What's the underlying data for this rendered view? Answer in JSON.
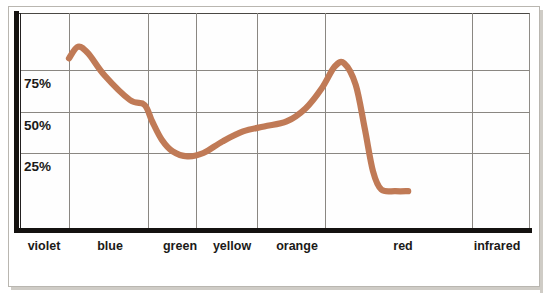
{
  "chart_data": {
    "type": "line",
    "title": "",
    "subtitle": "",
    "xlabel": "",
    "ylabel": "",
    "grid": true,
    "legend_position": "none",
    "ylim": [
      0,
      100
    ],
    "ytick_labels": [
      "75%",
      "50%",
      "25%"
    ],
    "ytick_values": [
      75,
      50,
      25
    ],
    "xtick_labels": [
      "violet",
      "blue",
      "green",
      "yellow",
      "orange",
      "red",
      "infrared"
    ],
    "series": [
      {
        "name": "reflectance",
        "color": "#c07a56",
        "x_labels": [
          "violet",
          "blue",
          "green",
          "yellow",
          "orange",
          "red",
          "infrared"
        ],
        "points": [
          {
            "x": 0.0,
            "y": 82
          },
          {
            "x": 0.14,
            "y": 89
          },
          {
            "x": 0.3,
            "y": 85
          },
          {
            "x": 0.55,
            "y": 72
          },
          {
            "x": 0.95,
            "y": 57
          },
          {
            "x": 1.18,
            "y": 54
          },
          {
            "x": 1.3,
            "y": 44
          },
          {
            "x": 1.45,
            "y": 33
          },
          {
            "x": 1.62,
            "y": 26
          },
          {
            "x": 1.85,
            "y": 23
          },
          {
            "x": 2.1,
            "y": 25
          },
          {
            "x": 2.4,
            "y": 32
          },
          {
            "x": 2.72,
            "y": 38
          },
          {
            "x": 3.05,
            "y": 41
          },
          {
            "x": 3.4,
            "y": 44
          },
          {
            "x": 3.7,
            "y": 52
          },
          {
            "x": 3.95,
            "y": 64
          },
          {
            "x": 4.15,
            "y": 77
          },
          {
            "x": 4.3,
            "y": 79
          },
          {
            "x": 4.48,
            "y": 66
          },
          {
            "x": 4.62,
            "y": 40
          },
          {
            "x": 4.75,
            "y": 14
          },
          {
            "x": 4.88,
            "y": 3
          },
          {
            "x": 5.1,
            "y": 2
          },
          {
            "x": 5.3,
            "y": 2
          }
        ],
        "annotations": [
          "first maximum near violet/blue boundary at about 89%",
          "minimum near green at about 23%",
          "second maximum just before red at about 79%",
          "falls to near 0% at red and stays flat toward infrared"
        ]
      }
    ]
  },
  "axes": {
    "y_ticks": [
      {
        "label": "75%",
        "pixel_y": 70
      },
      {
        "label": "50%",
        "pixel_y": 112
      },
      {
        "label": "25%",
        "pixel_y": 153
      }
    ],
    "x_ticks": [
      {
        "label": "violet",
        "pixel_x": 44,
        "gridline_x": 69
      },
      {
        "label": "blue",
        "pixel_x": 107,
        "gridline_x": 148
      },
      {
        "label": "green",
        "pixel_x": 177,
        "gridline_x": 196
      },
      {
        "label": "yellow",
        "pixel_x": 228,
        "gridline_x": 257
      },
      {
        "label": "orange",
        "pixel_x": 294,
        "gridline_x": 325
      },
      {
        "label": "red",
        "pixel_x": 402,
        "gridline_x": 472
      },
      {
        "label": "infrared",
        "pixel_x": 495,
        "gridline_x": null
      }
    ]
  },
  "colors": {
    "curve": "#c07a56",
    "axis": "#141210",
    "gridline": "#8a8782",
    "frame": "#b9b6b0",
    "text": "#1b1a18",
    "background": "#ffffff"
  }
}
